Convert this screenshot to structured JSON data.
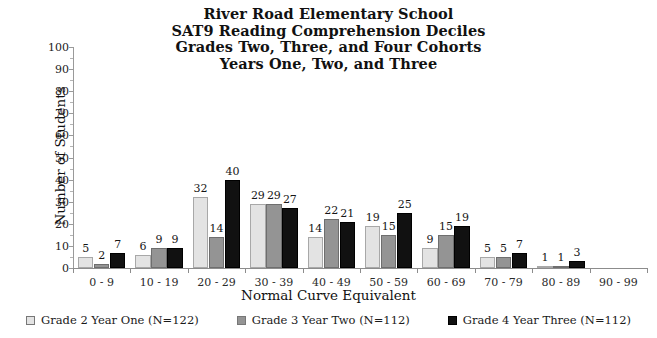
{
  "chart_data": {
    "type": "bar",
    "title": "River Road Elementary School\nSAT9 Reading Comprehension Deciles\nGrades Two, Three, and Four Cohorts\nYears One, Two, and Three",
    "title_lines": [
      "River Road Elementary School",
      "SAT9 Reading Comprehension Deciles",
      "Grades Two, Three, and Four Cohorts",
      "Years One, Two, and Three"
    ],
    "xlabel": "Normal Curve Equivalent",
    "ylabel": "Number of Students",
    "ylim": [
      0,
      100
    ],
    "ytick_step": 10,
    "yticks": [
      0,
      10,
      20,
      30,
      40,
      50,
      60,
      70,
      80,
      90,
      100
    ],
    "grid": false,
    "legend_position": "bottom",
    "categories": [
      "0 - 9",
      "10 - 19",
      "20 - 29",
      "30 - 39",
      "40 - 49",
      "50 - 59",
      "60 - 69",
      "70 - 79",
      "80 - 89",
      "90 - 99"
    ],
    "series": [
      {
        "name": "Grade 2 Year One (N=122)",
        "color": "#e3e3e3",
        "values": [
          5,
          6,
          32,
          29,
          14,
          19,
          9,
          5,
          1,
          0
        ]
      },
      {
        "name": "Grade 3 Year Two (N=112)",
        "color": "#949494",
        "values": [
          2,
          9,
          14,
          29,
          22,
          15,
          15,
          5,
          1,
          0
        ]
      },
      {
        "name": "Grade 4 Year Three (N=112)",
        "color": "#111111",
        "values": [
          7,
          9,
          40,
          27,
          21,
          25,
          19,
          7,
          3,
          0
        ]
      }
    ]
  }
}
